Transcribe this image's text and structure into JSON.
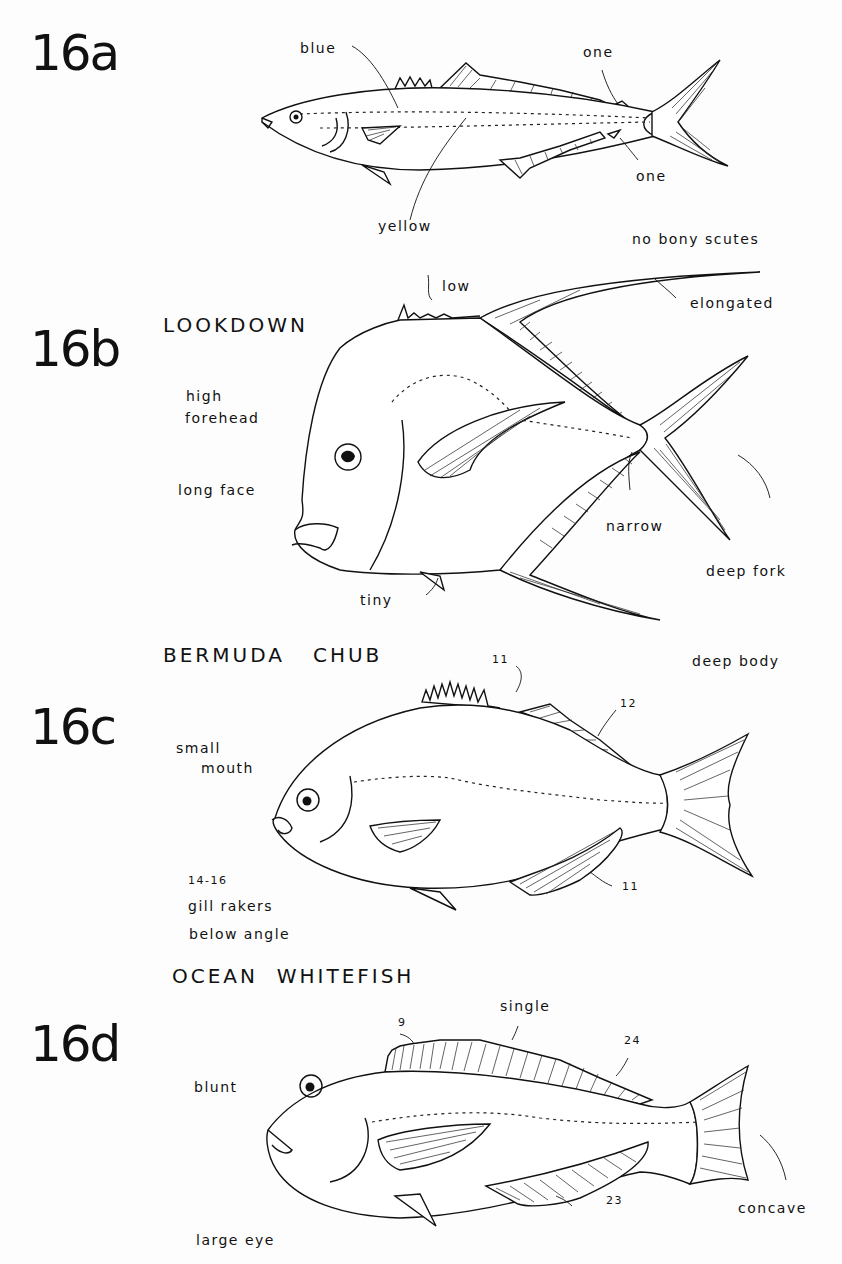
{
  "figures": [
    {
      "id": "16a",
      "name": "",
      "labels": {
        "blue": "blue",
        "yellow": "yellow",
        "one_top": "one",
        "one_bottom": "one",
        "scutes": "no bony scutes"
      }
    },
    {
      "id": "16b",
      "name": "LOOKDOWN",
      "labels": {
        "low": "low",
        "elongated": "elongated",
        "high": "high",
        "forehead": "forehead",
        "long_face": "long face",
        "narrow": "narrow",
        "deep_fork": "deep fork",
        "tiny": "tiny"
      }
    },
    {
      "id": "16c",
      "name": "BERMUDA   CHUB",
      "labels": {
        "deep_body": "deep body",
        "spines": "11",
        "soft_rays": "12",
        "small": "small",
        "mouth": "mouth",
        "anal_rays": "11",
        "rakers_count": "14-16",
        "gill_rakers": "gill rakers",
        "below_angle": "below angle"
      }
    },
    {
      "id": "16d",
      "name": "OCEAN  WHITEFISH",
      "labels": {
        "spines": "9",
        "single": "single",
        "dorsal_rays": "24",
        "blunt": "blunt",
        "anal_rays": "23",
        "concave": "concave",
        "large_eye": "large eye"
      }
    }
  ]
}
